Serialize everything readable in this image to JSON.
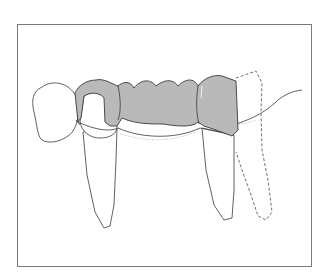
{
  "figure": {
    "colors": {
      "background": "#ffffff",
      "frame": "#7a7a7a",
      "bridge_fill": "#b9b9b9",
      "outline": "#3a3a3a"
    },
    "elements": [
      "adjacent-crown-left",
      "abutment-tooth-mesial",
      "bridge-retainer-mesial",
      "pontic",
      "bridge-retainer-distal",
      "abutment-tooth-distal",
      "missing-tooth-dashed-outline",
      "gingival-line"
    ]
  }
}
